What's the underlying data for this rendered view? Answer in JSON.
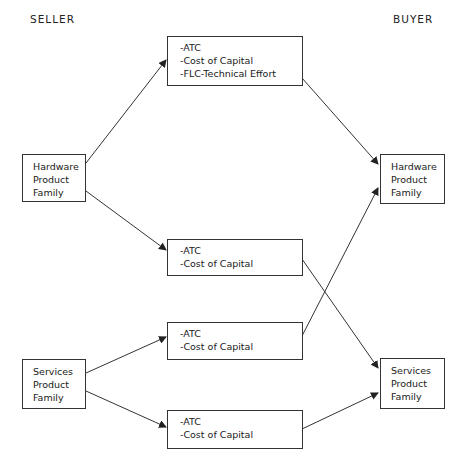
{
  "header": {
    "seller_label": "SELLER",
    "buyer_label": "BUYER"
  },
  "seller": {
    "hardware": {
      "lines": [
        "Hardware",
        "Product",
        "Family"
      ]
    },
    "services": {
      "lines": [
        "Services",
        "Product",
        "Family"
      ]
    }
  },
  "buyer": {
    "hardware": {
      "lines": [
        "Hardware",
        "Product",
        "Family"
      ]
    },
    "services": {
      "lines": [
        "Services",
        "Product",
        "Family"
      ]
    }
  },
  "transfers": [
    {
      "id": "hw-to-hw",
      "from": "seller.hardware",
      "to": "buyer.hardware",
      "lines": [
        "-ATC",
        "-Cost of Capital",
        "-FLC-Technical Effort"
      ]
    },
    {
      "id": "hw-to-svc",
      "from": "seller.hardware",
      "to": "buyer.services",
      "lines": [
        "-ATC",
        "-Cost of Capital"
      ]
    },
    {
      "id": "svc-to-hw",
      "from": "seller.services",
      "to": "buyer.hardware",
      "lines": [
        "-ATC",
        "-Cost of Capital"
      ]
    },
    {
      "id": "svc-to-svc",
      "from": "seller.services",
      "to": "buyer.services",
      "lines": [
        "-ATC",
        "-Cost of Capital"
      ]
    }
  ],
  "colors": {
    "line": "#333333",
    "text": "#1a1a1a",
    "background": "#ffffff"
  }
}
